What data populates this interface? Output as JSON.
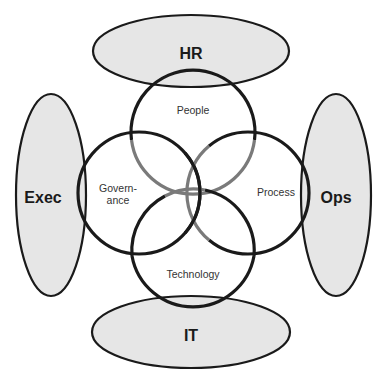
{
  "diagram": {
    "type": "overlapping-circles-with-stakeholder-ellipses",
    "colors": {
      "ellipse_fill": "#e6e6e6",
      "outline": "#1a1a1a",
      "interlace_gray": "#7a7a7a",
      "background": "#ffffff"
    },
    "stakeholders": [
      {
        "id": "hr",
        "label": "HR",
        "position": "top"
      },
      {
        "id": "exec",
        "label": "Exec",
        "position": "left"
      },
      {
        "id": "ops",
        "label": "Ops",
        "position": "right"
      },
      {
        "id": "it",
        "label": "IT",
        "position": "bottom"
      }
    ],
    "domains": [
      {
        "id": "people",
        "label": "People",
        "position": "top"
      },
      {
        "id": "governance",
        "label_line1": "Govern-",
        "label_line2": "ance",
        "position": "left"
      },
      {
        "id": "process",
        "label": "Process",
        "position": "right"
      },
      {
        "id": "technology",
        "label": "Technology",
        "position": "bottom"
      }
    ]
  }
}
